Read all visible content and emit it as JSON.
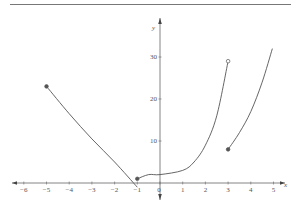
{
  "chart_data": {
    "type": "line",
    "title": "",
    "xlabel": "x",
    "ylabel": "y",
    "xlim": [
      -6.5,
      5.5
    ],
    "ylim": [
      -2,
      36
    ],
    "grid": false,
    "x_ticks": [
      "-6",
      "-5",
      "-4",
      "-3",
      "-2",
      "-1",
      "0",
      "1",
      "2",
      "3",
      "4",
      "5"
    ],
    "y_ticks": [
      "10",
      "20",
      "30"
    ],
    "series": [
      {
        "name": "piece-1",
        "points": [
          [
            -5,
            23
          ],
          [
            -4,
            16.5
          ],
          [
            -3,
            10.5
          ],
          [
            -2,
            5
          ],
          [
            -1,
            -1
          ]
        ],
        "start_marker": "closed",
        "end_marker": "none"
      },
      {
        "name": "piece-2",
        "points": [
          [
            -1,
            1
          ],
          [
            -0.5,
            2
          ],
          [
            0,
            2
          ],
          [
            1,
            3
          ],
          [
            1.5,
            5
          ],
          [
            2,
            9
          ],
          [
            2.5,
            16
          ],
          [
            3,
            29
          ]
        ],
        "start_marker": "closed",
        "end_marker": "open"
      },
      {
        "name": "piece-3",
        "points": [
          [
            3,
            8
          ],
          [
            3.5,
            12
          ],
          [
            4,
            17
          ],
          [
            4.5,
            24
          ],
          [
            4.95,
            32
          ]
        ],
        "start_marker": "closed",
        "end_marker": "none"
      }
    ],
    "markers": [
      {
        "x": -5,
        "y": 23,
        "type": "closed"
      },
      {
        "x": -1,
        "y": 1,
        "type": "closed"
      },
      {
        "x": 3,
        "y": 29,
        "type": "open"
      },
      {
        "x": 3,
        "y": 8,
        "type": "closed"
      }
    ]
  }
}
